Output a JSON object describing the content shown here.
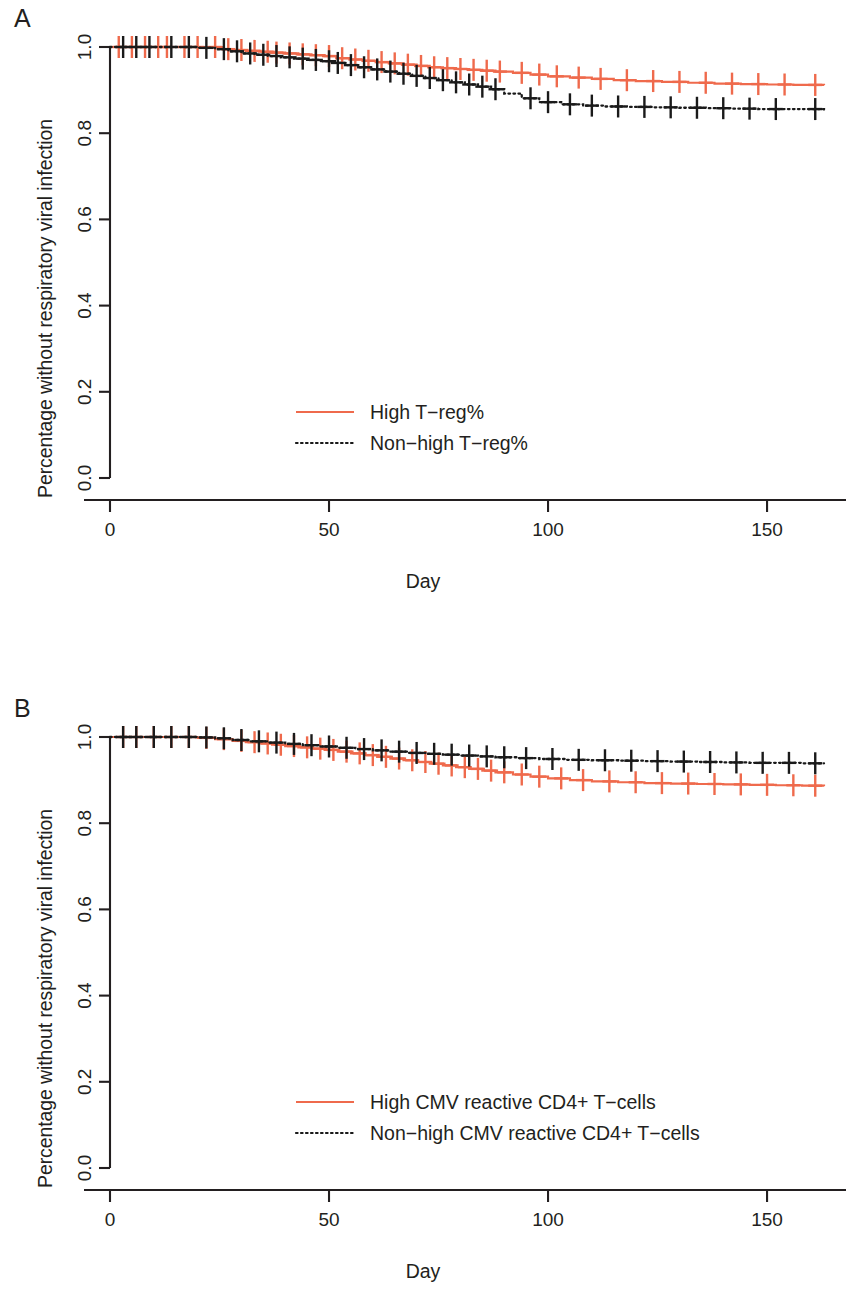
{
  "figure": {
    "panels": [
      {
        "letter": "A",
        "xlabel": "Day",
        "ylabel": "Percentage without respiratory viral infection"
      },
      {
        "letter": "B",
        "xlabel": "Day",
        "ylabel": "Percentage without respiratory viral infection"
      }
    ]
  },
  "chart_data": [
    {
      "type": "line",
      "panel": "A",
      "title": "",
      "xlabel": "Day",
      "ylabel": "Percentage without respiratory viral infection",
      "xlim": [
        0,
        163
      ],
      "ylim": [
        0.0,
        1.0
      ],
      "xticks": [
        0,
        50,
        100,
        150
      ],
      "xticklabels": [
        "0",
        "50",
        "100",
        "150"
      ],
      "yticks": [
        0.0,
        0.2,
        0.4,
        0.6,
        0.8,
        1.0
      ],
      "yticklabels": [
        "0.0",
        "0.2",
        "0.4",
        "0.6",
        "0.8",
        "1.0"
      ],
      "grid": false,
      "legend_position": "center",
      "series": [
        {
          "name": "High T-reg%",
          "label": "High T−reg%",
          "color": "#ef6a4c",
          "style": "solid",
          "x": [
            0,
            3,
            6,
            10,
            14,
            18,
            22,
            26,
            28,
            31,
            34,
            37,
            40,
            43,
            46,
            49,
            52,
            55,
            58,
            61,
            64,
            67,
            70,
            73,
            76,
            79,
            82,
            85,
            88,
            92,
            96,
            100,
            105,
            110,
            115,
            120,
            126,
            132,
            138,
            144,
            150,
            156,
            163
          ],
          "y": [
            1.0,
            1.0,
            1.0,
            1.0,
            1.0,
            1.0,
            1.0,
            0.995,
            0.993,
            0.991,
            0.989,
            0.987,
            0.985,
            0.983,
            0.981,
            0.979,
            0.974,
            0.971,
            0.968,
            0.965,
            0.962,
            0.959,
            0.956,
            0.953,
            0.951,
            0.949,
            0.947,
            0.945,
            0.943,
            0.94,
            0.936,
            0.932,
            0.929,
            0.926,
            0.923,
            0.921,
            0.919,
            0.917,
            0.915,
            0.914,
            0.913,
            0.912,
            0.911
          ],
          "censor_x": [
            2,
            5,
            8,
            11,
            13,
            17,
            20,
            24,
            27,
            30,
            33,
            36,
            38,
            41,
            44,
            47,
            50,
            53,
            56,
            59,
            62,
            65,
            68,
            71,
            74,
            77,
            80,
            83,
            86,
            89,
            94,
            98,
            102,
            107,
            112,
            118,
            124,
            130,
            136,
            142,
            148,
            154,
            161
          ]
        },
        {
          "name": "Non-high T-reg%",
          "label": "Non−high T−reg%",
          "color": "#1a1a1a",
          "style": "dotted",
          "x": [
            0,
            4,
            8,
            12,
            16,
            20,
            24,
            27,
            30,
            33,
            36,
            39,
            42,
            45,
            48,
            51,
            54,
            57,
            60,
            63,
            66,
            69,
            72,
            75,
            78,
            81,
            84,
            87,
            90,
            94,
            98,
            103,
            108,
            113,
            118,
            124,
            130,
            136,
            142,
            148,
            154,
            163
          ],
          "y": [
            1.0,
            1.0,
            1.0,
            1.0,
            1.0,
            0.998,
            0.995,
            0.99,
            0.985,
            0.982,
            0.979,
            0.976,
            0.973,
            0.97,
            0.967,
            0.963,
            0.958,
            0.953,
            0.948,
            0.943,
            0.938,
            0.933,
            0.928,
            0.923,
            0.918,
            0.913,
            0.908,
            0.902,
            0.892,
            0.881,
            0.872,
            0.867,
            0.864,
            0.862,
            0.861,
            0.86,
            0.859,
            0.858,
            0.857,
            0.856,
            0.856,
            0.855
          ],
          "censor_x": [
            3,
            6,
            9,
            14,
            18,
            22,
            26,
            29,
            32,
            35,
            38,
            41,
            44,
            47,
            50,
            52,
            55,
            58,
            61,
            64,
            67,
            70,
            73,
            76,
            79,
            82,
            85,
            88,
            96,
            100,
            105,
            110,
            116,
            122,
            128,
            134,
            140,
            146,
            152,
            161
          ]
        }
      ]
    },
    {
      "type": "line",
      "panel": "B",
      "title": "",
      "xlabel": "Day",
      "ylabel": "Percentage without respiratory viral infection",
      "xlim": [
        0,
        163
      ],
      "ylim": [
        0.0,
        1.0
      ],
      "xticks": [
        0,
        50,
        100,
        150
      ],
      "xticklabels": [
        "0",
        "50",
        "100",
        "150"
      ],
      "yticks": [
        0.0,
        0.2,
        0.4,
        0.6,
        0.8,
        1.0
      ],
      "yticklabels": [
        "0.0",
        "0.2",
        "0.4",
        "0.6",
        "0.8",
        "1.0"
      ],
      "grid": false,
      "legend_position": "center",
      "series": [
        {
          "name": "High CMV reactive CD4+ T-cells",
          "label": "High CMV reactive CD4+ T−cells",
          "color": "#ef6a4c",
          "style": "solid",
          "x": [
            0,
            4,
            8,
            12,
            16,
            20,
            24,
            28,
            31,
            34,
            37,
            40,
            43,
            46,
            49,
            52,
            55,
            58,
            61,
            64,
            67,
            70,
            73,
            76,
            79,
            82,
            85,
            88,
            92,
            96,
            100,
            105,
            110,
            116,
            122,
            128,
            134,
            140,
            146,
            152,
            158,
            163
          ],
          "y": [
            1.0,
            1.0,
            1.0,
            1.0,
            1.0,
            0.998,
            0.995,
            0.991,
            0.988,
            0.985,
            0.982,
            0.979,
            0.976,
            0.973,
            0.97,
            0.966,
            0.962,
            0.958,
            0.954,
            0.95,
            0.946,
            0.942,
            0.938,
            0.934,
            0.93,
            0.926,
            0.922,
            0.918,
            0.913,
            0.908,
            0.904,
            0.9,
            0.897,
            0.895,
            0.893,
            0.892,
            0.891,
            0.89,
            0.889,
            0.888,
            0.887,
            0.886
          ],
          "censor_x": [
            3,
            6,
            10,
            14,
            18,
            22,
            26,
            30,
            33,
            36,
            39,
            42,
            45,
            48,
            51,
            54,
            57,
            60,
            63,
            66,
            69,
            72,
            75,
            78,
            81,
            84,
            87,
            90,
            94,
            98,
            103,
            108,
            114,
            120,
            126,
            132,
            138,
            144,
            150,
            156,
            161
          ]
        },
        {
          "name": "Non-high CMV reactive CD4+ T-cells",
          "label": "Non−high CMV reactive CD4+ T−cells",
          "color": "#1a1a1a",
          "style": "dotted",
          "x": [
            0,
            4,
            8,
            12,
            16,
            20,
            24,
            28,
            32,
            36,
            40,
            44,
            48,
            52,
            56,
            60,
            64,
            68,
            72,
            76,
            80,
            84,
            88,
            93,
            98,
            104,
            110,
            116,
            122,
            128,
            134,
            140,
            146,
            152,
            158,
            163
          ],
          "y": [
            1.0,
            1.0,
            1.0,
            1.0,
            1.0,
            0.999,
            0.997,
            0.993,
            0.99,
            0.987,
            0.984,
            0.981,
            0.978,
            0.975,
            0.972,
            0.969,
            0.966,
            0.963,
            0.961,
            0.959,
            0.957,
            0.955,
            0.953,
            0.951,
            0.949,
            0.947,
            0.946,
            0.945,
            0.944,
            0.943,
            0.942,
            0.941,
            0.94,
            0.94,
            0.939,
            0.939
          ],
          "censor_x": [
            3,
            6,
            10,
            14,
            18,
            22,
            26,
            30,
            34,
            38,
            42,
            46,
            50,
            54,
            58,
            62,
            66,
            70,
            74,
            78,
            82,
            86,
            90,
            95,
            101,
            107,
            113,
            119,
            125,
            131,
            137,
            143,
            149,
            155,
            161
          ]
        }
      ]
    }
  ]
}
